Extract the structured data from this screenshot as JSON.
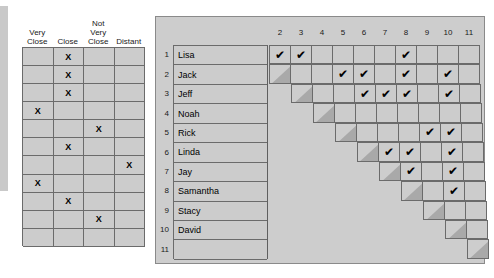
{
  "left_table": {
    "name": "closeness-rating-table",
    "headers": [
      "Very Close",
      "Close",
      "Not Very Close",
      "Distant"
    ],
    "header_lines": [
      [
        "Very",
        "Close"
      ],
      [
        "",
        "Close"
      ],
      [
        "Not",
        "Very",
        "Close"
      ],
      [
        "",
        "Distant"
      ]
    ],
    "columns": [
      "Very Close",
      "Close",
      "Not Very Close",
      "Distant"
    ],
    "mark_glyph": "X",
    "rows": [
      {
        "index": 1,
        "marked_column": 1
      },
      {
        "index": 2,
        "marked_column": 1
      },
      {
        "index": 3,
        "marked_column": 1
      },
      {
        "index": 4,
        "marked_column": 0
      },
      {
        "index": 5,
        "marked_column": 2
      },
      {
        "index": 6,
        "marked_column": 1
      },
      {
        "index": 7,
        "marked_column": 3
      },
      {
        "index": 8,
        "marked_column": 0
      },
      {
        "index": 9,
        "marked_column": 1
      },
      {
        "index": 10,
        "marked_column": 2
      },
      {
        "index": 11,
        "marked_column": -1
      }
    ]
  },
  "right_table": {
    "name": "peer-relationship-matrix",
    "column_headers": [
      "2",
      "3",
      "4",
      "5",
      "6",
      "7",
      "8",
      "9",
      "10",
      "11"
    ],
    "row_numbers": [
      "1",
      "2",
      "3",
      "4",
      "5",
      "6",
      "7",
      "8",
      "9",
      "10",
      "11"
    ],
    "names": [
      "Lisa",
      "Jack",
      "Jeff",
      "Noah",
      "Rick",
      "Linda",
      "Jay",
      "Samantha",
      "Stacy",
      "David",
      ""
    ],
    "check_glyph": "✔",
    "checks": {
      "1": [
        2,
        3,
        8
      ],
      "2": [
        5,
        6,
        8,
        10
      ],
      "3": [
        6,
        7,
        8,
        10
      ],
      "4": [],
      "5": [
        9,
        10
      ],
      "6": [
        7,
        8,
        10
      ],
      "7": [
        8,
        10
      ],
      "8": [
        10
      ],
      "9": [],
      "10": [],
      "11": []
    }
  },
  "colors": {
    "cell_fill": "#cccccc",
    "panel_fill": "#cdcdcd",
    "grid_line": "#6b6b6b",
    "diagonal_shade": "#a9a9a9",
    "shadow_plate": "#c9c9c9",
    "text": "#1a1a1a",
    "background": "#ffffff"
  }
}
